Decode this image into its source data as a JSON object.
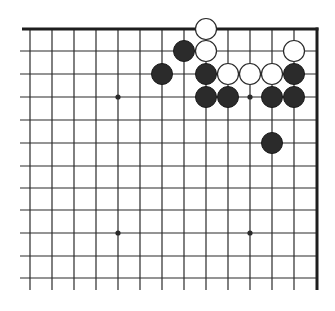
{
  "diagram": {
    "title": "Go board corner diagram (top-right)",
    "board": {
      "columns": 14,
      "rows": 12,
      "col_x": [
        30,
        52,
        74,
        96,
        118,
        140,
        162,
        184,
        206,
        228,
        250,
        272,
        294,
        317
      ],
      "row_y": [
        29,
        51,
        74,
        97,
        120,
        143,
        166,
        188,
        210,
        233,
        256,
        278
      ],
      "h_line_start_x": 20,
      "v_line_end_y": 290,
      "edges": [
        "top",
        "right"
      ],
      "line_color": "#2a2a2a",
      "background": "#ffffff"
    },
    "star_points": [
      {
        "col": 4,
        "row": 3
      },
      {
        "col": 10,
        "row": 3
      },
      {
        "col": 4,
        "row": 9
      },
      {
        "col": 10,
        "row": 9
      }
    ],
    "stones": {
      "white": [
        {
          "col": 8,
          "row": 0
        },
        {
          "col": 8,
          "row": 1
        },
        {
          "col": 12,
          "row": 1
        },
        {
          "col": 9,
          "row": 2
        },
        {
          "col": 10,
          "row": 2
        },
        {
          "col": 11,
          "row": 2
        }
      ],
      "black": [
        {
          "col": 7,
          "row": 1
        },
        {
          "col": 6,
          "row": 2
        },
        {
          "col": 8,
          "row": 2
        },
        {
          "col": 12,
          "row": 2
        },
        {
          "col": 8,
          "row": 3
        },
        {
          "col": 9,
          "row": 3
        },
        {
          "col": 11,
          "row": 3
        },
        {
          "col": 12,
          "row": 3
        },
        {
          "col": 11,
          "row": 5
        }
      ]
    },
    "stone_radius": 10.5,
    "colors": {
      "black_stone": "#2b2b2b",
      "white_stone": "#ffffff",
      "stone_outline": "#2a2a2a"
    }
  }
}
